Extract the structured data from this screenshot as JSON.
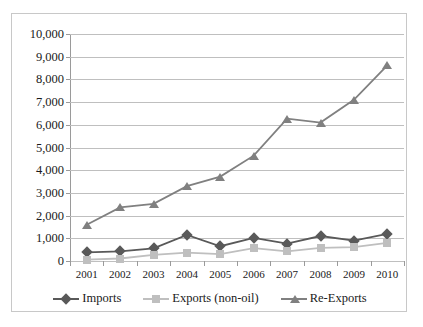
{
  "chart_data": {
    "type": "line",
    "title": "",
    "xlabel": "",
    "ylabel": "",
    "categories": [
      "2001",
      "2002",
      "2003",
      "2004",
      "2005",
      "2006",
      "2007",
      "2008",
      "2009",
      "2010"
    ],
    "ylim": [
      0,
      10000
    ],
    "ytick_step": 1000,
    "ytick_labels": [
      "10,000",
      "9,000",
      "8,000",
      "7,000",
      "6,000",
      "5,000",
      "4,000",
      "3,000",
      "2,000",
      "1,000",
      "0"
    ],
    "grid": true,
    "legend_position": "bottom",
    "series": [
      {
        "name": "Imports",
        "marker": "diamond",
        "color": "#595959",
        "values": [
          380,
          420,
          560,
          1150,
          650,
          1020,
          770,
          1100,
          900,
          1200
        ]
      },
      {
        "name": "Exports (non-oil)",
        "marker": "square",
        "color": "#bfbfbf",
        "values": [
          60,
          110,
          270,
          370,
          300,
          570,
          420,
          580,
          610,
          800
        ]
      },
      {
        "name": "Re-Exports",
        "marker": "triangle",
        "color": "#808080",
        "values": [
          1600,
          2360,
          2520,
          3300,
          3720,
          4640,
          6270,
          6100,
          7100,
          8620
        ]
      }
    ]
  },
  "legend": {
    "items": [
      {
        "label": "Imports",
        "marker": "diamond-marker-icon"
      },
      {
        "label": "Exports (non-oil)",
        "marker": "square-marker-icon"
      },
      {
        "label": "Re-Exports",
        "marker": "triangle-marker-icon"
      }
    ]
  },
  "colors": {
    "imports": "#595959",
    "exports": "#bfbfbf",
    "reexports": "#808080",
    "gridline": "#bfbfbf",
    "axis": "#9a9a9a",
    "border": "#c8c8c8",
    "text": "#1a1a1a"
  }
}
